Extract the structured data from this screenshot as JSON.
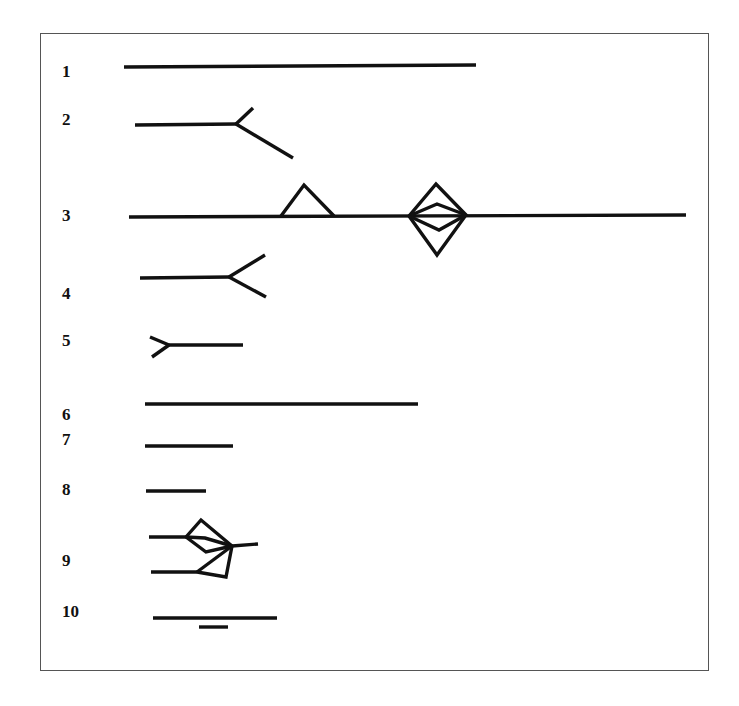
{
  "figure": {
    "type": "numbered line-symbol legend",
    "border_color": "#555555",
    "stroke_color": "#111111",
    "items": [
      {
        "label": "1",
        "label_pos": [
          62,
          63
        ],
        "shape": "long plain line"
      },
      {
        "label": "2",
        "label_pos": [
          62,
          111
        ],
        "shape": "line ending in asymmetric fork (short up, long down)"
      },
      {
        "label": "3",
        "label_pos": [
          62,
          207
        ],
        "shape": "long line with triangle and double-chevron diamond"
      },
      {
        "label": "4",
        "label_pos": [
          62,
          285
        ],
        "shape": "line ending in symmetric open fork"
      },
      {
        "label": "5",
        "label_pos": [
          62,
          332
        ],
        "shape": "short line with fork at start"
      },
      {
        "label": "6",
        "label_pos": [
          62,
          406
        ],
        "shape": "long plain line"
      },
      {
        "label": "7",
        "label_pos": [
          62,
          431
        ],
        "shape": "short plain line"
      },
      {
        "label": "8",
        "label_pos": [
          62,
          481
        ],
        "shape": "shorter plain line"
      },
      {
        "label": "9",
        "label_pos": [
          62,
          552
        ],
        "shape": "two lines converging via diamond and triangle to a single stub"
      },
      {
        "label": "10",
        "label_pos": [
          62,
          603
        ],
        "shape": "line with short underline"
      }
    ]
  }
}
